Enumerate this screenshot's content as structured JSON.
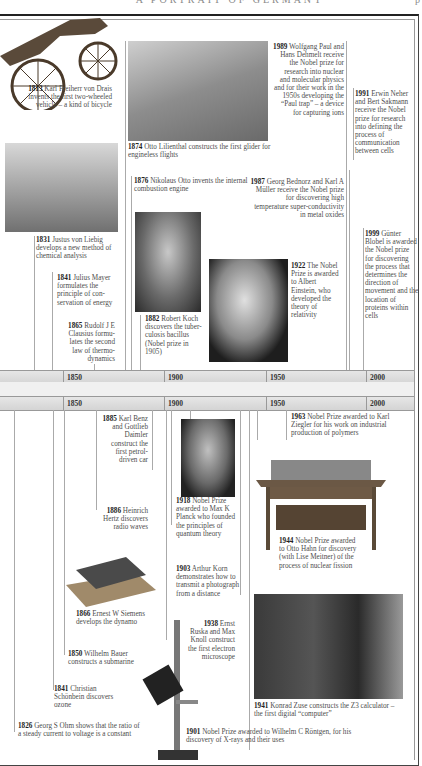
{
  "header": {
    "title": "A PORTRAIT OF GERMANY",
    "page": "p"
  },
  "timeline": {
    "ticks": [
      "1850",
      "1900",
      "1950",
      "2000"
    ]
  },
  "upper_entries": [
    {
      "year": "1813",
      "text": "Karl Freiherr von Drais invents the first two-wheeled vehicle – a kind of bicycle"
    },
    {
      "year": "1874",
      "text": "Otto Lilienthal constructs the first glider for engineless flights"
    },
    {
      "year": "1989",
      "text": "Wolfgang Paul and Hans Dehmelt receive the Nobel prize for research into nuclear and molecular physics and for their work in the 1950s developing the “Paul trap” – a device for capturing ions"
    },
    {
      "year": "1991",
      "text": "Erwin Neher and Bert Sakmann receive the Nobel prize for research into defining the process of communication between cells"
    },
    {
      "year": "1876",
      "text": "Nikolaus Otto invents the internal combustion engine"
    },
    {
      "year": "1987",
      "text": "Georg Bednorz and Karl A Müller receive the Nobel prize for discovering high temperature super-conductivity in metal oxides"
    },
    {
      "year": "1831",
      "text": "Justus von Liebig develops a new method of chemical analysis"
    },
    {
      "year": "1999",
      "text": "Günter Blobel is awarded the Nobel prize for discovering the process that determines the direction of movement and the location of proteins within cells"
    },
    {
      "year": "1841",
      "text": "Julius Mayer formulates the principle of con-servation of energy"
    },
    {
      "year": "1882",
      "text": "Robert Koch discovers the tuber-culosis bacillus (Nobel prize in 1905)"
    },
    {
      "year": "1922",
      "text": "The Nobel Prize is awarded to Albert Einstein, who developed the theory of relativity"
    },
    {
      "year": "1865",
      "text": "Rudolf J E Clausius formu-lates the second law of thermo-dynamics"
    }
  ],
  "lower_entries": [
    {
      "year": "1885",
      "text": "Karl Benz and Gottlieb Daimler construct the first petrol-driven car"
    },
    {
      "year": "1963",
      "text": "Nobel Prize awarded to Karl Ziegler for his work on industrial production of polymers"
    },
    {
      "year": "1918",
      "text": "Nobel Prize awarded to Max K Planck who founded the principles of quantum theory"
    },
    {
      "year": "1886",
      "text": "Heinrich Hertz discovers radio waves"
    },
    {
      "year": "1944",
      "text": "Nobel Prize awarded to Otto Hahn for discovery (with Lise Meitner) of the process of nuclear fission"
    },
    {
      "year": "1903",
      "text": "Arthur Korn demonstrates how to transmit a photograph from a distance"
    },
    {
      "year": "1866",
      "text": "Ernest W Siemens develops the dynamo"
    },
    {
      "year": "1938",
      "text": "Ernst Ruska and Max Knoll construct the first electron microscope"
    },
    {
      "year": "1850",
      "text": "Wilhelm Bauer constructs a submarine"
    },
    {
      "year": "1841",
      "text": "Christian Schönbein discovers ozone"
    },
    {
      "year": "1941",
      "text": "Konrad Zuse constructs the Z3 calculator – the first digital “computer”"
    },
    {
      "year": "1826",
      "text": "Georg S Ohm shows that the ratio of a steady current to voltage is a constant"
    },
    {
      "year": "1901",
      "text": "Nobel Prize awarded to Wilhelm C Röntgen, for his discovery of X-rays and their uses"
    }
  ],
  "images": {
    "bicycle": "Draisine two-wheeled vehicle",
    "glider": "Lilienthal glider",
    "lab": "Liebig laboratory",
    "koch": "Portrait of Robert Koch",
    "einstein": "Portrait of Albert Einstein",
    "planck": "Portrait of Max Planck",
    "hahn_table": "Otto Hahn's laboratory table",
    "dynamo": "Siemens dynamo",
    "microscope": "Electron microscope",
    "z3": "Zuse Z3 computer"
  }
}
